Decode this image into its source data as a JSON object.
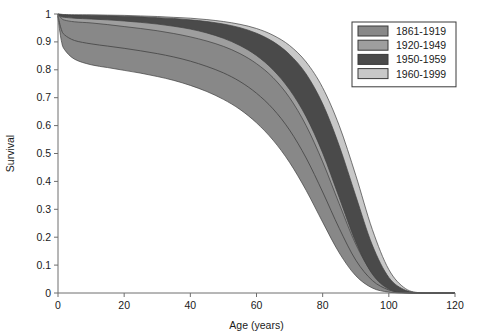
{
  "chart_data": {
    "type": "area",
    "title": "",
    "xlabel": "Age (years)",
    "ylabel": "Survival",
    "xlim": [
      0,
      120
    ],
    "ylim": [
      0,
      1
    ],
    "xticks": [
      0,
      20,
      40,
      60,
      80,
      100,
      120
    ],
    "xtick_labels": [
      "0",
      "20",
      "40",
      "60",
      "80",
      "100",
      "120"
    ],
    "yticks": [
      0,
      0.1,
      0.2,
      0.3,
      0.4,
      0.5,
      0.6,
      0.7,
      0.8,
      0.9,
      1
    ],
    "ytick_labels": [
      "0",
      "0.1",
      "0.2",
      "0.3",
      "0.4",
      "0.5",
      "0.6",
      "0.7",
      "0.8",
      "0.9",
      "1"
    ],
    "grid": false,
    "legend_position": "top-right",
    "x": [
      0,
      1,
      2,
      5,
      10,
      15,
      20,
      25,
      30,
      35,
      40,
      45,
      50,
      55,
      60,
      65,
      70,
      75,
      80,
      85,
      90,
      95,
      100,
      105,
      110,
      115,
      120
    ],
    "series": [
      {
        "name": "1861-1919",
        "color": "#888888",
        "upper": [
          1.0,
          0.985,
          0.978,
          0.972,
          0.968,
          0.962,
          0.955,
          0.948,
          0.94,
          0.93,
          0.918,
          0.903,
          0.884,
          0.858,
          0.822,
          0.772,
          0.7,
          0.6,
          0.47,
          0.32,
          0.175,
          0.072,
          0.02,
          0.004,
          0.0,
          0.0,
          0.0
        ],
        "lower": [
          0.985,
          0.905,
          0.872,
          0.838,
          0.818,
          0.808,
          0.798,
          0.788,
          0.776,
          0.762,
          0.744,
          0.722,
          0.694,
          0.658,
          0.61,
          0.548,
          0.468,
          0.368,
          0.254,
          0.144,
          0.062,
          0.018,
          0.003,
          0.0,
          0.0,
          0.0,
          0.0
        ],
        "median": [
          0.992,
          0.945,
          0.925,
          0.905,
          0.893,
          0.885,
          0.877,
          0.868,
          0.858,
          0.846,
          0.831,
          0.812,
          0.789,
          0.758,
          0.716,
          0.66,
          0.584,
          0.484,
          0.362,
          0.232,
          0.118,
          0.045,
          0.011,
          0.001,
          0.0,
          0.0,
          0.0
        ]
      },
      {
        "name": "1920-1949",
        "color": "#9e9e9e",
        "upper": [
          1.0,
          0.996,
          0.995,
          0.993,
          0.991,
          0.989,
          0.986,
          0.983,
          0.979,
          0.974,
          0.968,
          0.959,
          0.947,
          0.93,
          0.905,
          0.868,
          0.812,
          0.728,
          0.608,
          0.452,
          0.282,
          0.13,
          0.04,
          0.007,
          0.0,
          0.0,
          0.0
        ],
        "lower": [
          0.99,
          0.96,
          0.952,
          0.944,
          0.938,
          0.932,
          0.926,
          0.918,
          0.908,
          0.896,
          0.88,
          0.86,
          0.833,
          0.798,
          0.75,
          0.685,
          0.598,
          0.485,
          0.35,
          0.208,
          0.095,
          0.028,
          0.005,
          0.0,
          0.0,
          0.0,
          0.0
        ]
      },
      {
        "name": "1950-1959",
        "color": "#4a4a4a",
        "upper": [
          1.0,
          0.998,
          0.997,
          0.996,
          0.995,
          0.994,
          0.992,
          0.99,
          0.987,
          0.984,
          0.979,
          0.973,
          0.964,
          0.951,
          0.931,
          0.901,
          0.855,
          0.785,
          0.678,
          0.528,
          0.348,
          0.172,
          0.056,
          0.01,
          0.0,
          0.0,
          0.0
        ],
        "lower": [
          0.997,
          0.99,
          0.988,
          0.985,
          0.982,
          0.979,
          0.975,
          0.97,
          0.964,
          0.956,
          0.946,
          0.932,
          0.913,
          0.887,
          0.851,
          0.8,
          0.729,
          0.632,
          0.502,
          0.342,
          0.183,
          0.068,
          0.014,
          0.001,
          0.0,
          0.0,
          0.0
        ]
      },
      {
        "name": "1960-1999",
        "color": "#c8c8c8",
        "upper": [
          1.0,
          0.999,
          0.998,
          0.997,
          0.997,
          0.996,
          0.995,
          0.993,
          0.991,
          0.988,
          0.985,
          0.98,
          0.973,
          0.963,
          0.948,
          0.924,
          0.887,
          0.828,
          0.736,
          0.6,
          0.422,
          0.228,
          0.084,
          0.016,
          0.0,
          0.0,
          0.0
        ],
        "lower": [
          0.998,
          0.994,
          0.993,
          0.991,
          0.989,
          0.987,
          0.984,
          0.981,
          0.977,
          0.971,
          0.963,
          0.952,
          0.937,
          0.915,
          0.884,
          0.84,
          0.778,
          0.692,
          0.575,
          0.42,
          0.248,
          0.102,
          0.024,
          0.003,
          0.0,
          0.0,
          0.0
        ]
      }
    ]
  },
  "legend": {
    "entries": [
      {
        "label": "1861-1919",
        "color": "#888888"
      },
      {
        "label": "1920-1949",
        "color": "#9e9e9e"
      },
      {
        "label": "1950-1959",
        "color": "#4a4a4a"
      },
      {
        "label": "1960-1999",
        "color": "#c8c8c8"
      }
    ]
  }
}
